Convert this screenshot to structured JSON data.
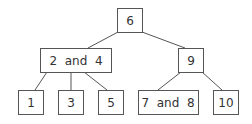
{
  "diagram": {
    "type": "tree",
    "nodes": {
      "root": {
        "label": "6"
      },
      "left": {
        "label": "2  and  4"
      },
      "right": {
        "label": "9"
      },
      "leaf1": {
        "label": "1"
      },
      "leaf3": {
        "label": "3"
      },
      "leaf5": {
        "label": "5"
      },
      "leaf78": {
        "label": "7  and  8"
      },
      "leaf10": {
        "label": "10"
      }
    },
    "edges": [
      [
        "root",
        "left"
      ],
      [
        "root",
        "right"
      ],
      [
        "left",
        "leaf1"
      ],
      [
        "left",
        "leaf3"
      ],
      [
        "left",
        "leaf5"
      ],
      [
        "right",
        "leaf78"
      ],
      [
        "right",
        "leaf10"
      ]
    ],
    "colors": {
      "stroke": "#555555",
      "text": "#333333",
      "background": "#ffffff"
    }
  }
}
